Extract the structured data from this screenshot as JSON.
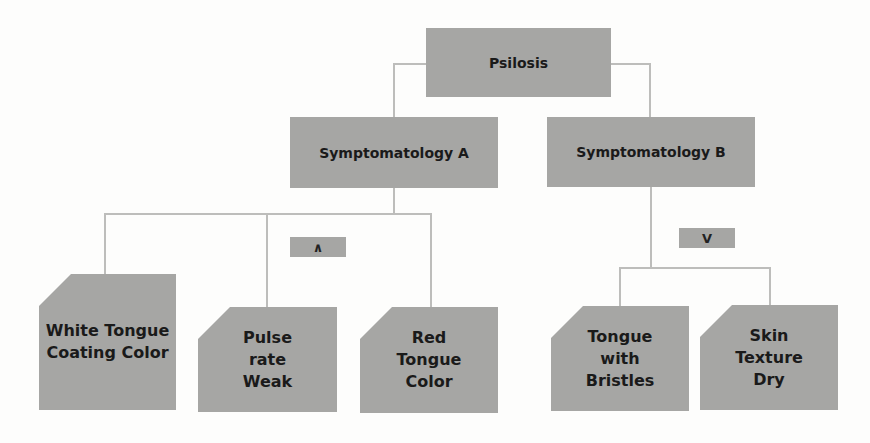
{
  "diagram": {
    "root": {
      "label": "Psilosis"
    },
    "branches": [
      {
        "label": "Symptomatology A",
        "operator": "∧",
        "operator_name": "AND",
        "children": [
          {
            "label": "White Tongue Coating Color"
          },
          {
            "label": "Pulse rate Weak"
          },
          {
            "label": "Red Tongue Color"
          }
        ]
      },
      {
        "label": "Symptomatology B",
        "operator": "V",
        "operator_name": "OR",
        "children": [
          {
            "label": "Tongue with Bristles"
          },
          {
            "label": "Skin Texture Dry"
          }
        ]
      }
    ]
  },
  "colors": {
    "box_fill": "#a6a6a4",
    "connector": "#bdbdbb",
    "text": "#1a1a1a",
    "background": "#fdfdfc"
  }
}
